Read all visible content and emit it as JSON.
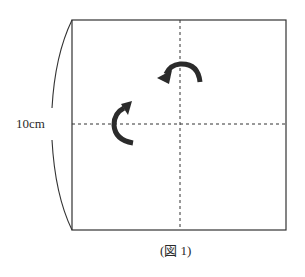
{
  "figure": {
    "caption": "(図 1)",
    "dimension_label": "10cm",
    "square": {
      "side": "10cm"
    },
    "fold_lines": [
      "vertical-center-dashed",
      "horizontal-center-dashed"
    ],
    "arrows": [
      {
        "name": "fold-arrow-top",
        "direction": "counterclockwise-leftward",
        "axis": "vertical"
      },
      {
        "name": "fold-arrow-left",
        "direction": "upward",
        "axis": "horizontal"
      }
    ],
    "colors": {
      "line": "#333333",
      "arrow": "#2b2b2b",
      "background": "#ffffff"
    }
  }
}
